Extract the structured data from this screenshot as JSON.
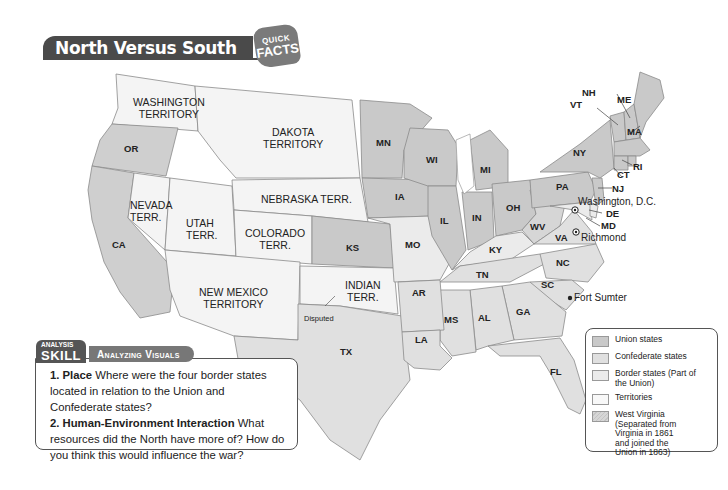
{
  "header": {
    "title": "North Versus South",
    "badge_top": "QUICK",
    "badge_bottom": "FACTS"
  },
  "map": {
    "states": {
      "OR": "OR",
      "CA": "CA",
      "MN": "MN",
      "WI": "WI",
      "MI": "MI",
      "IA": "IA",
      "IL": "IL",
      "IN": "IN",
      "OH": "OH",
      "PA": "PA",
      "NY": "NY",
      "VT": "VT",
      "NH": "NH",
      "ME": "ME",
      "MA": "MA",
      "RI": "RI",
      "CT": "CT",
      "NJ": "NJ",
      "DE": "DE",
      "MD": "MD",
      "WV": "WV",
      "VA": "VA",
      "KY": "KY",
      "MO": "MO",
      "KS": "KS",
      "TN": "TN",
      "NC": "NC",
      "SC": "SC",
      "GA": "GA",
      "AL": "AL",
      "MS": "MS",
      "AR": "AR",
      "LA": "LA",
      "TX": "TX",
      "FL": "FL"
    },
    "territories": {
      "washington": "WASHINGTON\nTERRITORY",
      "dakota": "DAKOTA\nTERRITORY",
      "nebraska": "NEBRASKA TERR.",
      "nevada": "NEVADA\nTERR.",
      "utah": "UTAH\nTERR.",
      "colorado": "COLORADO\nTERR.",
      "new_mexico": "NEW MEXICO\nTERRITORY",
      "indian": "INDIAN\nTERR."
    },
    "cities": {
      "washington_dc": "Washington, D.C.",
      "richmond": "Richmond",
      "fort_sumter": "Fort Sumter"
    },
    "disputed_label": "Disputed",
    "colors": {
      "union": "#c9c9c9",
      "confederate": "#e0e0e0",
      "border": "#ebebeb",
      "territory": "#f6f6f6",
      "west_virginia": "#d6d6d6",
      "water": "#ffffff",
      "outline": "#7a7a7a"
    }
  },
  "skill": {
    "tag_top": "ANALYSIS",
    "tag_main": "SKILL",
    "pill": "Analyzing Visuals",
    "q1_label": "1. Place",
    "q1_text": " Where were the four border states located in relation to the Union and Confederate states?",
    "q2_label": "2. Human-Environment Interaction",
    "q2_text": " What resources did the North have more of? How do you think this would influence the war?"
  },
  "legend": {
    "items": [
      {
        "label": "Union states",
        "color": "#c9c9c9"
      },
      {
        "label": "Confederate states",
        "color": "#e0e0e0"
      },
      {
        "label": "Border states (Part of the Union)",
        "color": "#ebebeb"
      },
      {
        "label": "Territories",
        "color": "#f8f8f8"
      },
      {
        "label": "West Virginia (Separated from Virginia in 1861 and joined the Union in 1863)",
        "color": "#d6d6d6"
      }
    ]
  }
}
